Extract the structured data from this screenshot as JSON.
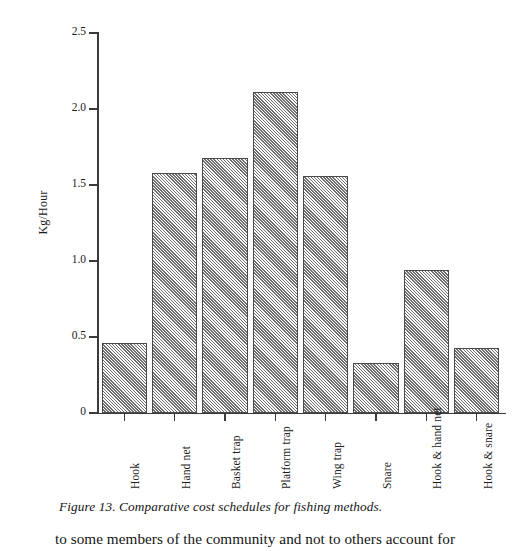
{
  "figure": {
    "caption": "Figure 13. Comparative cost schedules for fishing methods."
  },
  "body_text": {
    "line": "to some members of the community and not to others account for"
  },
  "chart_data": {
    "type": "bar",
    "title": "",
    "xlabel": "",
    "ylabel": "Kg/Hour",
    "ylim": [
      0,
      2.5
    ],
    "ytick_labels": [
      "0",
      "0.5",
      "1.0",
      "1.5",
      "2.0",
      "2.5"
    ],
    "ytick_values": [
      0,
      0.5,
      1.0,
      1.5,
      2.0,
      2.5
    ],
    "grid": false,
    "legend": false,
    "bar_fill": "#cfcfcf",
    "bar_edge": "#4a4a4a",
    "axis_color": "#3a3a3a",
    "categories": [
      "Hook",
      "Hand net",
      "Basket trap",
      "Platform trap",
      "Wing trap",
      "Snare",
      "Hook & hand net",
      "Hook & snare"
    ],
    "values": [
      0.46,
      1.58,
      1.68,
      2.11,
      1.56,
      0.33,
      0.94,
      0.43
    ]
  }
}
